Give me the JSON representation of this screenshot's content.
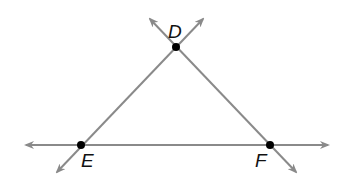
{
  "diagram": {
    "type": "geometry-triangle-with-lines",
    "line_color": "#8a8a8a",
    "point_color": "#000000",
    "points": [
      {
        "label": "D",
        "x": 176,
        "y": 47
      },
      {
        "label": "E",
        "x": 81,
        "y": 145
      },
      {
        "label": "F",
        "x": 270,
        "y": 145
      }
    ],
    "lines": [
      {
        "name": "line-EF",
        "through": [
          "E",
          "F"
        ],
        "from": [
          26,
          145
        ],
        "to": [
          328,
          145
        ]
      },
      {
        "name": "line-DE",
        "through": [
          "D",
          "E"
        ],
        "from": [
          203,
          19
        ],
        "to": [
          57,
          172
        ]
      },
      {
        "name": "line-DF",
        "through": [
          "D",
          "F"
        ],
        "from": [
          150,
          19
        ],
        "to": [
          296,
          172
        ]
      }
    ]
  }
}
